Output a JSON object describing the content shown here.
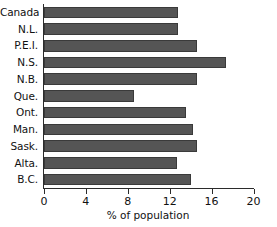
{
  "chart_data": {
    "type": "bar",
    "orientation": "horizontal",
    "title": "",
    "xlabel": "% of population",
    "ylabel": "",
    "xlim": [
      0,
      20
    ],
    "ylim": null,
    "grid": false,
    "legend": null,
    "xticks": [
      0,
      4,
      8,
      12,
      16,
      20
    ],
    "xticklabels": [
      "0",
      "4",
      "8",
      "12",
      "16",
      "20"
    ],
    "categories": [
      "Canada",
      "N.L.",
      "P.E.I.",
      "N.S.",
      "N.B.",
      "Que.",
      "Ont.",
      "Man.",
      "Sask.",
      "Alta.",
      "B.C."
    ],
    "values": [
      12.8,
      12.8,
      14.6,
      17.4,
      14.6,
      8.6,
      13.6,
      14.2,
      14.6,
      12.7,
      14.0
    ],
    "series": [
      {
        "name": "% of population",
        "values": [
          12.8,
          12.8,
          14.6,
          17.4,
          14.6,
          8.6,
          13.6,
          14.2,
          14.6,
          12.7,
          14.0
        ]
      }
    ],
    "bar_color": "#555555",
    "bar_edge_color": "#3a3a3a",
    "axis_color": "#2b2b2b",
    "background": "#ffffff"
  }
}
